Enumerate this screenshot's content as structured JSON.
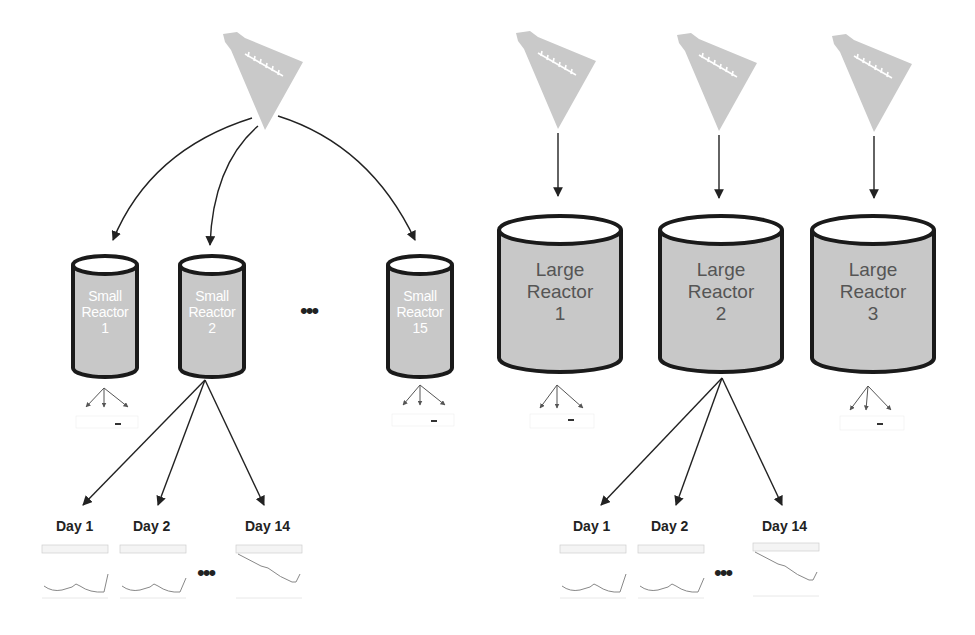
{
  "diagram": {
    "left_group": {
      "flask": {
        "icon": "flask-icon"
      },
      "reactors": [
        {
          "label_line1": "Small",
          "label_line2": "Reactor",
          "number": "1"
        },
        {
          "label_line1": "Small",
          "label_line2": "Reactor",
          "number": "2"
        },
        {
          "label_line1": "Small",
          "label_line2": "Reactor",
          "number": "15"
        }
      ],
      "ellipsis": "•••",
      "days": [
        {
          "label": "Day 1",
          "chart_label": "1"
        },
        {
          "label": "Day 2",
          "chart_label": "2"
        },
        {
          "label": "Day 14",
          "chart_label": "14"
        }
      ],
      "days_ellipsis": "•••"
    },
    "right_group": {
      "flasks": [
        {
          "icon": "flask-icon"
        },
        {
          "icon": "flask-icon"
        },
        {
          "icon": "flask-icon"
        }
      ],
      "reactors": [
        {
          "label_line1": "Large",
          "label_line2": "Reactor",
          "number": "1"
        },
        {
          "label_line1": "Large",
          "label_line2": "Reactor",
          "number": "2"
        },
        {
          "label_line1": "Large",
          "label_line2": "Reactor",
          "number": "3"
        }
      ],
      "days": [
        {
          "label": "Day 1",
          "chart_label": "1"
        },
        {
          "label": "Day 2",
          "chart_label": "2"
        },
        {
          "label": "Day 14",
          "chart_label": "14"
        }
      ],
      "days_ellipsis": "•••"
    },
    "colors": {
      "reactor_fill": "#c8c8c8",
      "reactor_stroke": "#1a1a1a",
      "flask_fill": "#c9c9c9",
      "arrow": "#222222"
    }
  }
}
